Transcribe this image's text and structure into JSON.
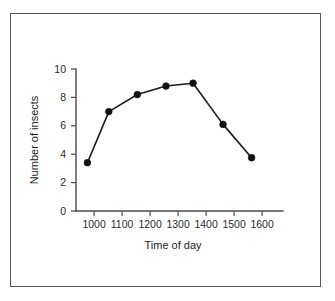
{
  "figure": {
    "frame_color": "#57575a",
    "background": "#ffffff"
  },
  "chart_data": {
    "type": "line",
    "title": "",
    "subtitle": "",
    "xlabel": "Time of day",
    "ylabel": "Number of insects",
    "x": [
      975,
      1050,
      1150,
      1250,
      1345,
      1450,
      1550
    ],
    "values": [
      3.4,
      7.0,
      8.2,
      8.8,
      9.0,
      6.1,
      3.75
    ],
    "series": [
      {
        "name": "Number of insects",
        "x": [
          975,
          1050,
          1150,
          1250,
          1345,
          1450,
          1550
        ],
        "values": [
          3.4,
          7.0,
          8.2,
          8.8,
          9.0,
          6.1,
          3.75
        ],
        "line_color": "#1a1a1a",
        "marker_color": "#111111",
        "marker": "circle"
      }
    ],
    "xlim": [
      935,
      1660
    ],
    "ylim": [
      0,
      10
    ],
    "xticks": [
      1000,
      1100,
      1200,
      1300,
      1400,
      1500,
      1600
    ],
    "xtick_labels": [
      "1000",
      "1100",
      "1200",
      "1300",
      "1400",
      "1500",
      "1600"
    ],
    "yticks": [
      0,
      2,
      4,
      6,
      8,
      10
    ],
    "ytick_labels": [
      "0",
      "2",
      "4",
      "6",
      "8",
      "10"
    ],
    "grid": false,
    "legend": null,
    "legend_position": "none",
    "annotations": []
  }
}
